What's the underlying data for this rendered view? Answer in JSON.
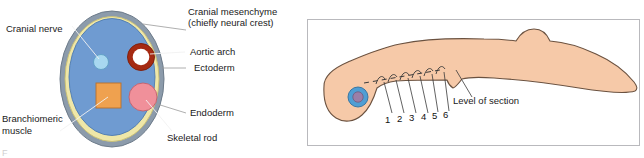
{
  "figure": {
    "type": "biological-diagram",
    "panels": 2
  },
  "cross_section": {
    "title": "pharyngeal-arch-cross-section",
    "structures": [
      {
        "name": "ectoderm",
        "label": "Ectoderm",
        "color": "#8c9bab",
        "shape": "outer-ring"
      },
      {
        "name": "endoderm",
        "label": "Endoderm",
        "color": "#efe7a8",
        "shape": "inner-lower-ring"
      },
      {
        "name": "cranial-mesenchyme",
        "label": "Cranial mesenchyme\n(chiefly neural crest)",
        "color": "#6f9bd1",
        "shape": "core-fill"
      },
      {
        "name": "cranial-nerve",
        "label": "Cranial nerve",
        "color": "#a8d8f0",
        "shape": "small-circle"
      },
      {
        "name": "aortic-arch",
        "label": "Aortic arch",
        "color": "#a52a12",
        "shape": "ring"
      },
      {
        "name": "branchiomeric-muscle",
        "label": "Branchiomeric\nmuscle",
        "color": "#efa14f",
        "shape": "square"
      },
      {
        "name": "skeletal-rod",
        "label": "Skeletal rod",
        "color": "#f0909a",
        "shape": "circle"
      }
    ],
    "labels": {
      "cranial_nerve": "Cranial nerve",
      "cranial_mesenchyme_line1": "Cranial mesenchyme",
      "cranial_mesenchyme_line2": "(chiefly neural crest)",
      "aortic_arch": "Aortic arch",
      "ectoderm": "Ectoderm",
      "endoderm": "Endoderm",
      "skeletal_rod": "Skeletal rod",
      "branchiomeric_line1": "Branchiomeric",
      "branchiomeric_line2": "muscle"
    }
  },
  "embryo_panel": {
    "title": "lateral-embryo-view",
    "body_color": "#f6c9a8",
    "outline_color": "#6b5240",
    "eye": {
      "name": "eye",
      "outer_color": "#4f9ed4",
      "inner_color": "#9b7fa8"
    },
    "level_of_section_label": "Level of section",
    "arch_numbers": [
      "1",
      "2",
      "3",
      "4",
      "5",
      "6"
    ],
    "arch_count": 6
  },
  "caption": {
    "stub": "F"
  }
}
